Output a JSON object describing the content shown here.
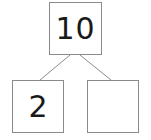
{
  "number_bond": {
    "whole": "10",
    "parts": [
      "2",
      ""
    ]
  },
  "colors": {
    "border": "#8a8a8a",
    "text": "#1a1a1a",
    "background": "#ffffff"
  }
}
